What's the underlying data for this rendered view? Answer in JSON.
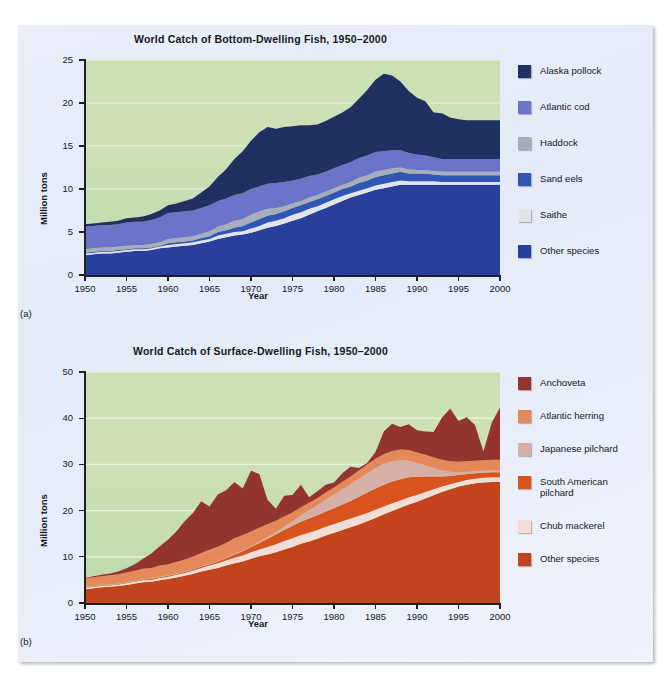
{
  "figure": {
    "background_color": "#e7edf7",
    "plot_background_top": "#ccdfb3",
    "plot_background_bottom": "#bcd8ad"
  },
  "panels": [
    {
      "letter": "(a)",
      "chart_data": {
        "type": "area",
        "title": "World Catch of Bottom-Dwelling Fish, 1950–2000",
        "xlabel": "Year",
        "ylabel": "Million tons",
        "xlim": [
          1950,
          2000
        ],
        "ylim": [
          0,
          25
        ],
        "xticks": [
          1950,
          1955,
          1960,
          1965,
          1970,
          1975,
          1980,
          1985,
          1990,
          1995,
          2000
        ],
        "yticks": [
          0,
          5,
          10,
          15,
          20,
          25
        ],
        "grid": true,
        "grid_color": "#eaf3e0",
        "stacked": true,
        "legend_position": "right",
        "x": [
          1950,
          1951,
          1952,
          1953,
          1954,
          1955,
          1956,
          1957,
          1958,
          1959,
          1960,
          1961,
          1962,
          1963,
          1964,
          1965,
          1966,
          1967,
          1968,
          1969,
          1970,
          1971,
          1972,
          1973,
          1974,
          1975,
          1976,
          1977,
          1978,
          1979,
          1980,
          1981,
          1982,
          1983,
          1984,
          1985,
          1986,
          1987,
          1988,
          1989,
          1990,
          1991,
          1992,
          1993,
          1994,
          1995,
          1996,
          1997,
          1998,
          1999,
          2000
        ],
        "series": [
          {
            "name": "Other species",
            "color": "#2a3f9c",
            "values": [
              2.3,
              2.4,
              2.5,
              2.5,
              2.6,
              2.7,
              2.8,
              2.8,
              2.9,
              3.1,
              3.2,
              3.3,
              3.4,
              3.5,
              3.7,
              3.9,
              4.2,
              4.4,
              4.6,
              4.7,
              4.9,
              5.2,
              5.5,
              5.7,
              6.0,
              6.3,
              6.6,
              7.0,
              7.4,
              7.8,
              8.2,
              8.6,
              9.0,
              9.3,
              9.6,
              9.9,
              10.1,
              10.3,
              10.5,
              10.5,
              10.5,
              10.5,
              10.5,
              10.5,
              10.5,
              10.5,
              10.5,
              10.5,
              10.5,
              10.5,
              10.5
            ]
          },
          {
            "name": "Saithe",
            "color": "#e2e4ea",
            "values": [
              0.2,
              0.2,
              0.2,
              0.2,
              0.2,
              0.2,
              0.2,
              0.2,
              0.2,
              0.2,
              0.3,
              0.3,
              0.3,
              0.3,
              0.3,
              0.3,
              0.4,
              0.4,
              0.4,
              0.4,
              0.5,
              0.5,
              0.6,
              0.6,
              0.6,
              0.7,
              0.7,
              0.7,
              0.6,
              0.6,
              0.6,
              0.6,
              0.5,
              0.5,
              0.5,
              0.5,
              0.5,
              0.5,
              0.5,
              0.4,
              0.4,
              0.4,
              0.4,
              0.3,
              0.3,
              0.3,
              0.3,
              0.3,
              0.3,
              0.3,
              0.3
            ]
          },
          {
            "name": "Sand eels",
            "color": "#2f56b5",
            "values": [
              0.1,
              0.1,
              0.1,
              0.1,
              0.1,
              0.1,
              0.1,
              0.1,
              0.1,
              0.1,
              0.2,
              0.2,
              0.2,
              0.2,
              0.3,
              0.3,
              0.4,
              0.4,
              0.5,
              0.6,
              0.7,
              0.8,
              0.8,
              0.8,
              0.8,
              0.8,
              0.8,
              0.8,
              0.8,
              0.8,
              0.8,
              0.8,
              0.8,
              0.9,
              0.9,
              1.0,
              1.0,
              1.0,
              1.0,
              0.9,
              0.9,
              0.9,
              0.8,
              0.8,
              0.8,
              0.8,
              0.8,
              0.8,
              0.8,
              0.8,
              0.8
            ]
          },
          {
            "name": "Haddock",
            "color": "#a7adbb",
            "values": [
              0.4,
              0.4,
              0.4,
              0.4,
              0.4,
              0.4,
              0.4,
              0.4,
              0.4,
              0.4,
              0.5,
              0.5,
              0.5,
              0.5,
              0.5,
              0.6,
              0.6,
              0.7,
              0.8,
              0.8,
              0.9,
              0.9,
              0.8,
              0.7,
              0.6,
              0.5,
              0.5,
              0.5,
              0.5,
              0.5,
              0.5,
              0.5,
              0.5,
              0.6,
              0.6,
              0.6,
              0.6,
              0.6,
              0.5,
              0.5,
              0.4,
              0.4,
              0.4,
              0.4,
              0.4,
              0.4,
              0.4,
              0.4,
              0.4,
              0.4,
              0.4
            ]
          },
          {
            "name": "Atlantic cod",
            "color": "#6a74c8",
            "values": [
              2.7,
              2.6,
              2.6,
              2.6,
              2.6,
              2.7,
              2.7,
              2.7,
              2.8,
              2.9,
              3.0,
              3.0,
              3.0,
              3.0,
              3.0,
              3.0,
              3.0,
              3.0,
              3.0,
              3.0,
              3.0,
              2.9,
              2.9,
              2.9,
              2.8,
              2.7,
              2.6,
              2.5,
              2.4,
              2.3,
              2.3,
              2.3,
              2.3,
              2.3,
              2.3,
              2.3,
              2.2,
              2.1,
              2.0,
              1.9,
              1.8,
              1.7,
              1.6,
              1.5,
              1.5,
              1.5,
              1.5,
              1.5,
              1.5,
              1.5,
              1.5
            ]
          },
          {
            "name": "Alaska pollock",
            "color": "#1f3160",
            "values": [
              0.2,
              0.3,
              0.3,
              0.4,
              0.4,
              0.5,
              0.5,
              0.6,
              0.7,
              0.8,
              0.9,
              1.0,
              1.2,
              1.4,
              1.8,
              2.2,
              2.8,
              3.4,
              4.2,
              4.9,
              5.6,
              6.3,
              6.6,
              6.3,
              6.4,
              6.3,
              6.2,
              5.9,
              5.8,
              5.9,
              6.0,
              6.1,
              6.4,
              6.9,
              7.6,
              8.4,
              9.0,
              8.7,
              8.0,
              7.2,
              6.6,
              6.3,
              5.2,
              5.3,
              4.8,
              4.6,
              4.5,
              4.5,
              4.5,
              4.5,
              4.5
            ]
          }
        ]
      },
      "legend": [
        {
          "label": "Alaska pollock",
          "color": "#1f3160"
        },
        {
          "label": "Atlantic cod",
          "color": "#6a74c8"
        },
        {
          "label": "Haddock",
          "color": "#a7adbb"
        },
        {
          "label": "Sand eels",
          "color": "#2f56b5"
        },
        {
          "label": "Saithe",
          "color": "#e2e4ea"
        },
        {
          "label": "Other species",
          "color": "#2a3f9c"
        }
      ]
    },
    {
      "letter": "(b)",
      "chart_data": {
        "type": "area",
        "title": "World Catch of Surface-Dwelling Fish, 1950–2000",
        "xlabel": "Year",
        "ylabel": "Million tons",
        "xlim": [
          1950,
          2000
        ],
        "ylim": [
          0,
          50
        ],
        "xticks": [
          1950,
          1955,
          1960,
          1965,
          1970,
          1975,
          1980,
          1985,
          1990,
          1995,
          2000
        ],
        "yticks": [
          0,
          10,
          20,
          30,
          40,
          50
        ],
        "grid": true,
        "grid_color": "#eaf3e0",
        "stacked": true,
        "legend_position": "right",
        "x": [
          1950,
          1951,
          1952,
          1953,
          1954,
          1955,
          1956,
          1957,
          1958,
          1959,
          1960,
          1961,
          1962,
          1963,
          1964,
          1965,
          1966,
          1967,
          1968,
          1969,
          1970,
          1971,
          1972,
          1973,
          1974,
          1975,
          1976,
          1977,
          1978,
          1979,
          1980,
          1981,
          1982,
          1983,
          1984,
          1985,
          1986,
          1987,
          1988,
          1989,
          1990,
          1991,
          1992,
          1993,
          1994,
          1995,
          1996,
          1997,
          1998,
          1999,
          2000
        ],
        "series": [
          {
            "name": "Other species",
            "color": "#c3431c",
            "values": [
              3.0,
              3.2,
              3.4,
              3.5,
              3.7,
              3.9,
              4.2,
              4.5,
              4.6,
              4.9,
              5.2,
              5.5,
              5.9,
              6.3,
              6.8,
              7.2,
              7.6,
              8.1,
              8.6,
              9.0,
              9.6,
              10.1,
              10.5,
              11.0,
              11.6,
              12.1,
              12.8,
              13.3,
              13.9,
              14.6,
              15.2,
              15.8,
              16.4,
              17.0,
              17.7,
              18.4,
              19.2,
              19.9,
              20.6,
              21.3,
              21.9,
              22.6,
              23.3,
              24.0,
              24.6,
              25.2,
              25.6,
              25.9,
              26.1,
              26.2,
              26.2
            ]
          },
          {
            "name": "Chub mackerel",
            "color": "#f2ded7",
            "values": [
              0.3,
              0.3,
              0.3,
              0.3,
              0.3,
              0.4,
              0.4,
              0.4,
              0.4,
              0.5,
              0.5,
              0.6,
              0.6,
              0.7,
              0.8,
              0.9,
              1.0,
              1.1,
              1.2,
              1.3,
              1.4,
              1.5,
              1.6,
              1.7,
              1.8,
              1.9,
              1.9,
              1.9,
              1.9,
              1.9,
              1.9,
              1.9,
              1.9,
              1.9,
              1.8,
              1.8,
              1.7,
              1.7,
              1.6,
              1.6,
              1.5,
              1.4,
              1.3,
              1.2,
              1.1,
              1.0,
              1.0,
              1.0,
              1.0,
              1.0,
              1.0
            ]
          },
          {
            "name": "South American pilchard",
            "color": "#d9531f",
            "values": [
              0.1,
              0.1,
              0.1,
              0.1,
              0.1,
              0.1,
              0.1,
              0.2,
              0.2,
              0.2,
              0.2,
              0.2,
              0.2,
              0.2,
              0.3,
              0.3,
              0.4,
              0.5,
              0.7,
              0.9,
              1.1,
              1.4,
              1.8,
              2.1,
              2.4,
              2.7,
              2.9,
              3.1,
              3.2,
              3.3,
              3.4,
              3.6,
              3.8,
              4.1,
              4.4,
              4.6,
              4.7,
              4.7,
              4.6,
              4.3,
              3.9,
              3.4,
              2.8,
              2.2,
              1.8,
              1.5,
              1.3,
              1.2,
              1.1,
              1.1,
              1.1
            ]
          },
          {
            "name": "Japanese pilchard",
            "color": "#d6b0a6",
            "values": [
              0.1,
              0.1,
              0.1,
              0.1,
              0.1,
              0.1,
              0.1,
              0.1,
              0.1,
              0.1,
              0.1,
              0.1,
              0.1,
              0.1,
              0.1,
              0.1,
              0.1,
              0.1,
              0.2,
              0.2,
              0.2,
              0.3,
              0.4,
              0.5,
              0.7,
              1.0,
              1.4,
              1.8,
              2.2,
              2.6,
              3.0,
              3.3,
              3.6,
              3.9,
              4.2,
              4.4,
              4.5,
              4.4,
              4.1,
              3.6,
              3.0,
              2.4,
              1.8,
              1.3,
              0.9,
              0.6,
              0.5,
              0.4,
              0.4,
              0.4,
              0.4
            ]
          },
          {
            "name": "Atlantic herring",
            "color": "#e5885a",
            "values": [
              1.8,
              1.9,
              1.9,
              2.0,
              2.0,
              2.1,
              2.2,
              2.2,
              2.3,
              2.4,
              2.4,
              2.5,
              2.6,
              2.7,
              2.8,
              3.0,
              3.1,
              3.2,
              3.3,
              3.3,
              3.2,
              3.0,
              2.8,
              2.5,
              2.2,
              1.9,
              1.7,
              1.6,
              1.5,
              1.5,
              1.5,
              1.6,
              1.7,
              1.8,
              1.9,
              2.0,
              2.1,
              2.2,
              2.3,
              2.3,
              2.3,
              2.3,
              2.3,
              2.3,
              2.3,
              2.3,
              2.3,
              2.3,
              2.3,
              2.3,
              2.3
            ]
          },
          {
            "name": "Anchoveta",
            "color": "#93352e",
            "values": [
              0.1,
              0.2,
              0.3,
              0.4,
              0.6,
              0.9,
              1.4,
              2.2,
              3.1,
              4.2,
              5.3,
              6.6,
              8.3,
              9.5,
              11.2,
              9.4,
              11.3,
              11.4,
              12.2,
              10.1,
              13.1,
              11.6,
              5.2,
              2.6,
              4.5,
              3.8,
              4.9,
              1.2,
              1.5,
              1.7,
              1.1,
              1.9,
              2.1,
              0.5,
              0.3,
              1.5,
              4.9,
              5.9,
              4.9,
              5.6,
              4.8,
              5.0,
              5.5,
              9.1,
              11.4,
              8.8,
              9.5,
              7.7,
              1.9,
              8.0,
              11.3
            ]
          }
        ]
      },
      "legend": [
        {
          "label": "Anchoveta",
          "color": "#93352e"
        },
        {
          "label": "Atlantic herring",
          "color": "#e5885a"
        },
        {
          "label": "Japanese pilchard",
          "color": "#d6b0a6"
        },
        {
          "label": "South American\npilchard",
          "color": "#d9531f"
        },
        {
          "label": "Chub mackerel",
          "color": "#f2ded7"
        },
        {
          "label": "Other species",
          "color": "#c3431c"
        }
      ]
    }
  ]
}
